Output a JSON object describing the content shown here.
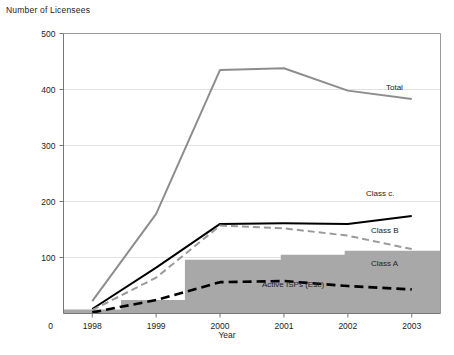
{
  "chart_data": {
    "type": "line",
    "title": "",
    "ylabel": "Number of Licensees",
    "xlabel": "Year",
    "categories": [
      "1998",
      "1999",
      "2000",
      "2001",
      "2002",
      "2003"
    ],
    "x_tick_labels": [
      "1998",
      "1999",
      "2000",
      "2001",
      "2002",
      "2003"
    ],
    "y_tick_labels": [
      "0",
      "100",
      "200",
      "300",
      "400",
      "500"
    ],
    "y_ticks": [
      0,
      100,
      200,
      300,
      400,
      500
    ],
    "ylim": [
      0,
      500
    ],
    "grid": "horizontal",
    "legend": "inline-labels",
    "origin_label": "0",
    "series": [
      {
        "name": "Total",
        "label": "Total",
        "style": "solid",
        "color": "#8d8d8d",
        "width": 2,
        "values": [
          22,
          178,
          435,
          438,
          398,
          383
        ]
      },
      {
        "name": "Class C",
        "label": "Class c.",
        "style": "solid",
        "color": "#000000",
        "width": 2,
        "values": [
          8,
          82,
          160,
          161,
          160,
          174
        ]
      },
      {
        "name": "Class B",
        "label": "Class B",
        "style": "dashed",
        "color": "#9a9a9a",
        "width": 2,
        "values": [
          6,
          64,
          157,
          152,
          139,
          115
        ]
      },
      {
        "name": "Class A",
        "label": "Class A",
        "style": "dashed",
        "color": "#000000",
        "width": 2.6,
        "values": [
          2,
          24,
          56,
          58,
          49,
          43
        ]
      }
    ],
    "area_series": {
      "name": "Active ISPs (Est.)",
      "label": "Active ISPs (Est.)",
      "type": "step-area",
      "color": "#a8a8a8",
      "steps": [
        {
          "from": 1997.55,
          "to": 1998.45,
          "value": 7
        },
        {
          "from": 1998.45,
          "to": 1999.45,
          "value": 24
        },
        {
          "from": 1999.45,
          "to": 2000.95,
          "value": 96
        },
        {
          "from": 2000.95,
          "to": 2001.95,
          "value": 105
        },
        {
          "from": 2001.95,
          "to": 2003.45,
          "value": 112
        }
      ]
    }
  }
}
